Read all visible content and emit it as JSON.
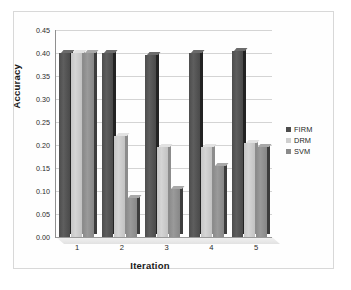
{
  "chart_data": {
    "type": "bar",
    "title": "",
    "xlabel": "Iteration",
    "ylabel": "Accuracy",
    "categories": [
      "1",
      "2",
      "3",
      "4",
      "5"
    ],
    "series": [
      {
        "name": "FIRM",
        "values": [
          0.4,
          0.4,
          0.395,
          0.4,
          0.405
        ],
        "color": "#4d4d4d"
      },
      {
        "name": "DRM",
        "values": [
          0.4,
          0.22,
          0.195,
          0.195,
          0.205
        ],
        "color": "#cfcfcf"
      },
      {
        "name": "SVM",
        "values": [
          0.4,
          0.085,
          0.105,
          0.155,
          0.195
        ],
        "color": "#8a8a8a"
      }
    ],
    "ylim": [
      0.0,
      0.45
    ],
    "yticks": [
      "0.00",
      "0.05",
      "0.10",
      "0.15",
      "0.20",
      "0.25",
      "0.30",
      "0.35",
      "0.40",
      "0.45"
    ],
    "ytick_values": [
      0.0,
      0.05,
      0.1,
      0.15,
      0.2,
      0.25,
      0.3,
      0.35,
      0.4,
      0.45
    ],
    "grid": "horizontal",
    "legend_position": "right",
    "style": "3d-clustered-column"
  },
  "legend": {
    "entries": [
      {
        "label": "FIRM"
      },
      {
        "label": "DRM"
      },
      {
        "label": "SVM"
      }
    ]
  }
}
